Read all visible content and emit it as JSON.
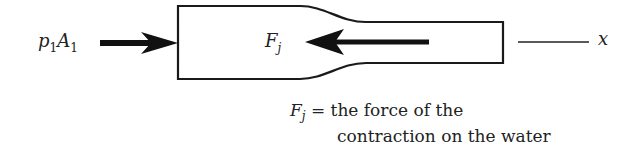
{
  "diagram": {
    "left_force": {
      "symbol_p": "p",
      "sub_p": "1",
      "symbol_a": "A",
      "sub_a": "1"
    },
    "inner_force": {
      "symbol": "F",
      "sub": "j"
    },
    "axis_label": "x",
    "caption": {
      "symbol": "F",
      "sub": "j",
      "line1": " = the force of the",
      "line2": "contraction on the water"
    },
    "colors": {
      "stroke": "#1a1a1a",
      "text": "#222222"
    }
  }
}
